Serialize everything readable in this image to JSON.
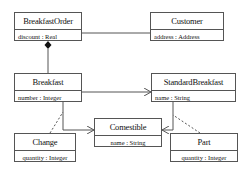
{
  "diagram": {
    "type": "uml-class-diagram",
    "classes": {
      "breakfast_order": {
        "name": "BreakfastOrder",
        "attribute": "discount : Real"
      },
      "customer": {
        "name": "Customer",
        "attribute": "address : Address"
      },
      "breakfast": {
        "name": "Breakfast",
        "attribute": "number : Integer"
      },
      "standard_breakfast": {
        "name": "StandardBreakfast",
        "attribute": "name : String"
      },
      "comestible": {
        "name": "Comestible",
        "attribute": "name : String"
      },
      "change": {
        "name": "Change",
        "attribute": "quantity : Integer"
      },
      "part": {
        "name": "Part",
        "attribute": "quantity : Integer"
      }
    },
    "relationships": [
      {
        "from": "BreakfastOrder",
        "to": "Customer",
        "kind": "association"
      },
      {
        "from": "BreakfastOrder",
        "to": "Breakfast",
        "kind": "composition"
      },
      {
        "from": "Breakfast",
        "to": "StandardBreakfast",
        "kind": "directed-association"
      },
      {
        "from": "Breakfast",
        "to": "Comestible",
        "kind": "directed-association"
      },
      {
        "from": "StandardBreakfast",
        "to": "Comestible",
        "kind": "directed-association"
      },
      {
        "from": "Change",
        "to": "Breakfast-Comestible",
        "kind": "association-class"
      },
      {
        "from": "Part",
        "to": "StandardBreakfast-Comestible",
        "kind": "association-class"
      }
    ],
    "colors": {
      "line": "#555555",
      "text": "#111111",
      "background": "#ffffff"
    }
  }
}
